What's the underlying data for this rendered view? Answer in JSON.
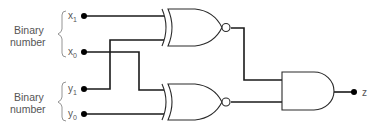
{
  "diagram": {
    "groups": [
      {
        "label_line1": "Binary",
        "label_line2": "number",
        "inputs": [
          "x1",
          "x0"
        ]
      },
      {
        "label_line1": "Binary",
        "label_line2": "number",
        "inputs": [
          "y1",
          "y0"
        ]
      }
    ],
    "inputs": [
      {
        "id": "x1",
        "base": "x",
        "sub": "1"
      },
      {
        "id": "x0",
        "base": "x",
        "sub": "0"
      },
      {
        "id": "y1",
        "base": "y",
        "sub": "1"
      },
      {
        "id": "y0",
        "base": "y",
        "sub": "0"
      }
    ],
    "gates": [
      {
        "id": "xnor_top",
        "type": "XNOR",
        "inputs": [
          "x1",
          "y1"
        ]
      },
      {
        "id": "xnor_bottom",
        "type": "XNOR",
        "inputs": [
          "x0",
          "y0"
        ]
      },
      {
        "id": "and_out",
        "type": "AND",
        "inputs": [
          "xnor_top",
          "xnor_bottom"
        ],
        "output": "z"
      }
    ],
    "output": {
      "label": "z"
    },
    "colors": {
      "wire": "#1a1a1a",
      "label": "#555555",
      "gate_stroke": "#2a2a2a"
    }
  }
}
